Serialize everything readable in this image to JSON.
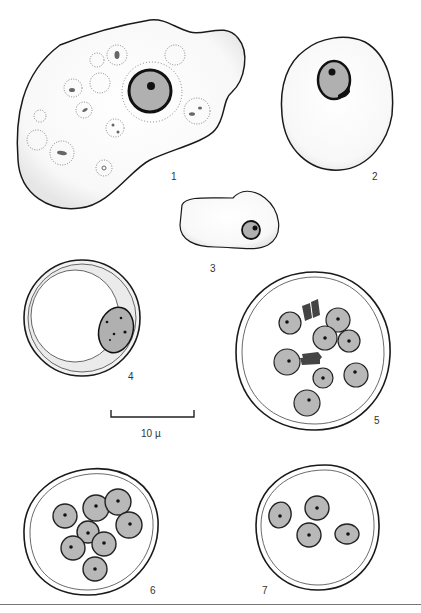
{
  "plate": {
    "figures": [
      {
        "id": 1,
        "label": "1",
        "description": "trophozoite with ingested vacuoles and large nucleus"
      },
      {
        "id": 2,
        "label": "2",
        "description": "rounded cell with nucleus"
      },
      {
        "id": 3,
        "label": "3",
        "description": "small elongated cell with nucleus"
      },
      {
        "id": 4,
        "label": "4",
        "description": "cyst with wall and eccentric nucleus"
      },
      {
        "id": 5,
        "label": "5",
        "description": "cyst with eight nuclei and chromatoid bodies"
      },
      {
        "id": 6,
        "label": "6",
        "description": "cyst with eight nuclei"
      },
      {
        "id": 7,
        "label": "7",
        "description": "cyst with four nuclei"
      }
    ],
    "scale_bar": {
      "label": "10 µ"
    }
  },
  "colors": {
    "outline": "#1a1a1a",
    "cell_fill": "#f7f7f7",
    "nucleus_fill": "#b8b8b8",
    "chromatin": "#111111",
    "label": "#333333"
  }
}
